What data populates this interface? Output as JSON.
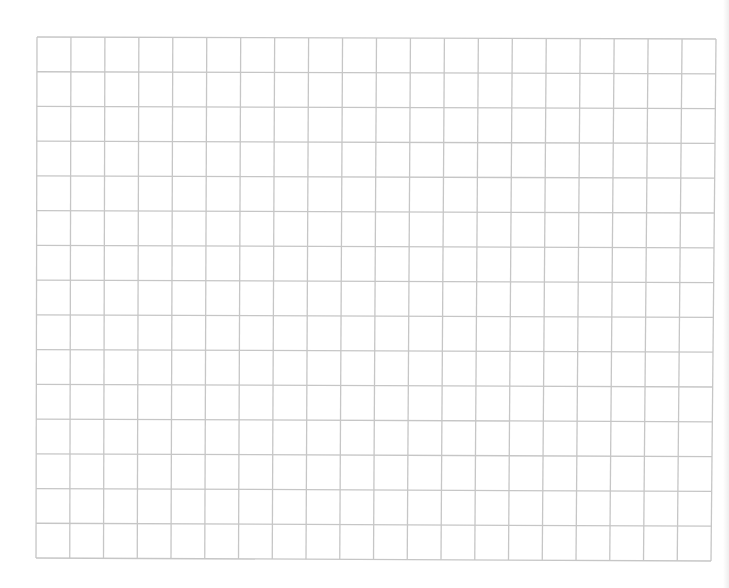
{
  "grid": {
    "columns": 20,
    "rows": 15,
    "top_left": [
      37,
      37
    ],
    "top_right": [
      716,
      39
    ],
    "bottom_left": [
      36,
      558
    ],
    "bottom_right": [
      711,
      561
    ],
    "line_color": "#c6c6c6",
    "background_color": "#ffffff",
    "line_width": 1.3
  }
}
